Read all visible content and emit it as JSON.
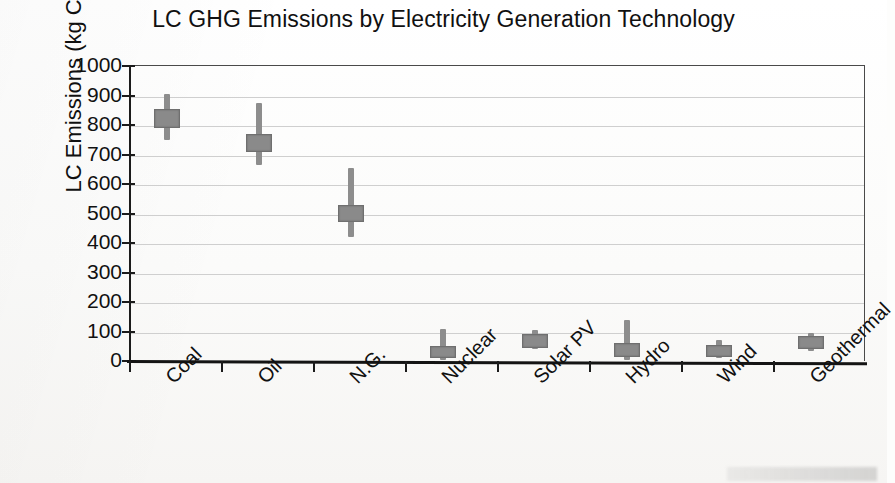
{
  "chart_data": {
    "type": "bar",
    "title": "LC GHG Emissions by Electricity Generation Technology",
    "xlabel": "",
    "ylabel": "LC Emissions (kg CO2/MWh)",
    "ylabel_prefix": "LC Emissions (kg CO",
    "ylabel_sub": "2",
    "ylabel_suffix": "/MWh)",
    "ylim": [
      0,
      1000
    ],
    "ytick_labels": [
      "1000",
      "900",
      "800",
      "700",
      "600",
      "500",
      "400",
      "300",
      "200",
      "100",
      "0"
    ],
    "ytick_values": [
      1000,
      900,
      800,
      700,
      600,
      500,
      400,
      300,
      200,
      100,
      0
    ],
    "grid": true,
    "legend": "none",
    "marker_style": "box-and-whisker (range bar with median box)",
    "marker_color": "#8a8a8a",
    "categories": [
      "Coal",
      "Oil",
      "N.G.",
      "Nuclear",
      "Solar PV",
      "Hydro",
      "Wind",
      "Geothermal"
    ],
    "values": [
      820,
      740,
      500,
      30,
      65,
      55,
      35,
      60
    ],
    "series": [
      {
        "name": "LC GHG emissions range",
        "points": [
          {
            "category": "Coal",
            "low": 750,
            "box_low": 790,
            "median": 820,
            "box_high": 855,
            "high": 905
          },
          {
            "category": "Oil",
            "low": 665,
            "box_low": 710,
            "median": 740,
            "box_high": 770,
            "high": 875
          },
          {
            "category": "N.G.",
            "low": 420,
            "box_low": 470,
            "median": 500,
            "box_high": 530,
            "high": 655
          },
          {
            "category": "Nuclear",
            "low": 5,
            "box_low": 10,
            "median": 30,
            "box_high": 50,
            "high": 110
          },
          {
            "category": "Solar PV",
            "low": 40,
            "box_low": 45,
            "median": 65,
            "box_high": 90,
            "high": 105
          },
          {
            "category": "Hydro",
            "low": 5,
            "box_low": 12,
            "median": 55,
            "box_high": 62,
            "high": 140
          },
          {
            "category": "Wind",
            "low": 10,
            "box_low": 15,
            "median": 35,
            "box_high": 55,
            "high": 70
          },
          {
            "category": "Geothermal",
            "low": 35,
            "box_low": 40,
            "median": 60,
            "box_high": 85,
            "high": 95
          }
        ]
      }
    ]
  }
}
